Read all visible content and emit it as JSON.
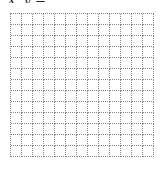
{
  "header": {
    "clipped_label": "x, y = ___"
  },
  "grid": {
    "columns": 13,
    "rows": 13,
    "cell_size_px": 11,
    "line_color": "#888888",
    "line_style": "dotted"
  }
}
